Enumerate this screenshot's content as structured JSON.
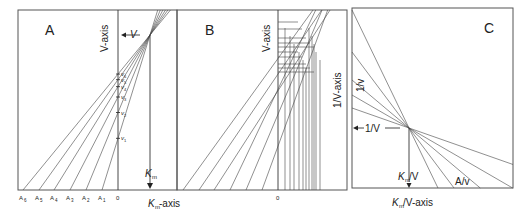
{
  "panels": [
    {
      "id": "A",
      "label": "A",
      "y_axis_label": "V-axis",
      "x_axis_label_main": "K",
      "x_axis_label_sub": "m",
      "x_axis_label_suffix": "-axis",
      "intercept_label": "V",
      "km_label_main": "K",
      "km_label_sub": "m",
      "origin_label": "0",
      "x_ticks": [
        {
          "main": "A",
          "sub": "6"
        },
        {
          "main": "A",
          "sub": "5"
        },
        {
          "main": "A",
          "sub": "4"
        },
        {
          "main": "A",
          "sub": "3"
        },
        {
          "main": "A",
          "sub": "2"
        },
        {
          "main": "A",
          "sub": "1"
        }
      ],
      "v_ticks": [
        {
          "main": "v",
          "sub": "6"
        },
        {
          "main": "v",
          "sub": "5"
        },
        {
          "main": "v",
          "sub": "4"
        },
        {
          "main": "v",
          "sub": "3"
        },
        {
          "main": "v",
          "sub": "2"
        },
        {
          "main": "v",
          "sub": "1"
        }
      ]
    },
    {
      "id": "B",
      "label": "B",
      "y_axis_label": "V-axis",
      "right_axis_label": "1/V-axis",
      "origin_label": "0"
    },
    {
      "id": "C",
      "label": "C",
      "y_axis_label": "1/v",
      "intercept_label": "1/V",
      "x_intercept_main": "K",
      "x_intercept_sub": "m",
      "x_intercept_suffix": "/V",
      "x_axis_label_main": "K",
      "x_axis_label_sub": "m",
      "x_axis_label_suffix": "/V-axis",
      "slope_label": "A/v"
    }
  ]
}
